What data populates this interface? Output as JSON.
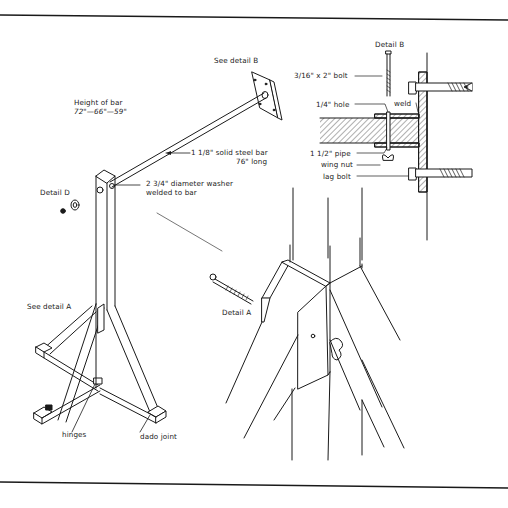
{
  "figure": {
    "labels": {
      "see_detail_b": "See detail B",
      "detail_b": "Detail B",
      "height_of_bar_title": "Height of bar",
      "height_of_bar_values": "72\"—66\"—59\"",
      "steel_bar_line1": "1 1/8\" solid steel bar",
      "steel_bar_line2": "76\" long",
      "washer_line1": "2 3/4\" diameter washer",
      "washer_line2": "welded to bar",
      "detail_d": "Detail D",
      "see_detail_a": "See detail A",
      "detail_a": "Detail A",
      "hinges": "hinges",
      "dado_joint": "dado joint",
      "bolt_b": "3/16\" x 2\" bolt",
      "hole": "1/4\" hole",
      "weld": "weld",
      "pipe": "1 1/2\" pipe",
      "wing_nut": "wing nut",
      "lag_bolt": "lag bolt"
    },
    "colors": {
      "ink": "#1a1a1a",
      "background": "#ffffff"
    }
  }
}
